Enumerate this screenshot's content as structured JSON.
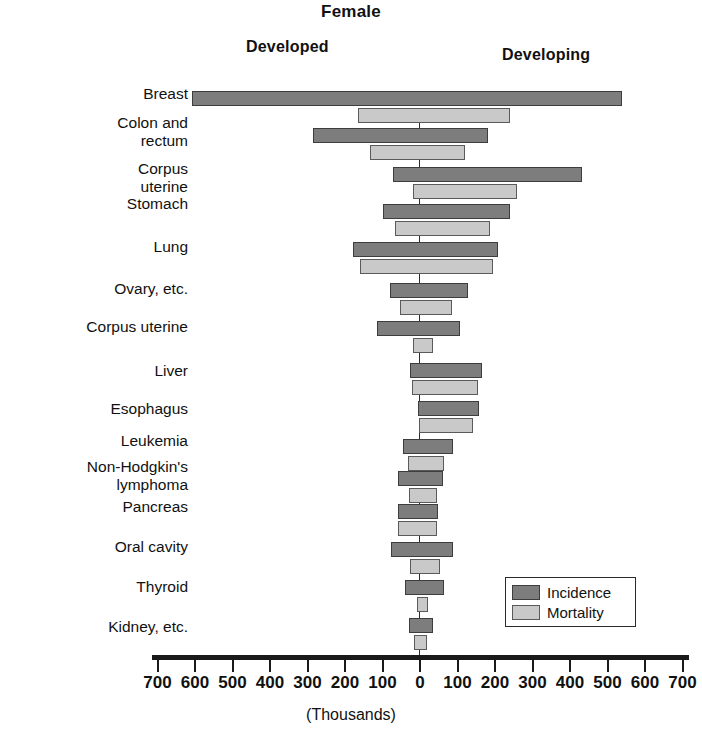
{
  "header": {
    "title": "Female",
    "left_region": "Developed",
    "right_region": "Developing"
  },
  "legend": {
    "incidence_label": "Incidence",
    "mortality_label": "Mortality",
    "incidence_color": "#7d7d7d",
    "mortality_color": "#c9c9c9"
  },
  "axis": {
    "title": "(Thousands)",
    "ticks": [
      "700",
      "600",
      "500",
      "400",
      "300",
      "200",
      "100",
      "0",
      "100",
      "200",
      "300",
      "400",
      "500",
      "600",
      "700"
    ],
    "zero_index": 7
  },
  "chart_data": {
    "type": "bar",
    "title": "Female",
    "subtitle": "",
    "xlabel": "(Thousands)",
    "ylabel": "",
    "orientation": "horizontal-diverging",
    "xlim": [
      -700,
      700
    ],
    "grid": false,
    "legend_position": "bottom-right",
    "legend_entries": [
      "Incidence",
      "Mortality"
    ],
    "left_side": "Developed",
    "right_side": "Developing",
    "units": "thousands of cases",
    "categories": [
      "Breast",
      "Colon and\nrectum",
      "Corpus\nuterine",
      "Stomach",
      "Lung",
      "Ovary, etc.",
      "Corpus uterine",
      "Liver",
      "Esophagus",
      "Leukemia",
      "Non-Hodgkin's\nlymphoma",
      "Pancreas",
      "Oral cavity",
      "Thyroid",
      "Kidney, etc."
    ],
    "series": [
      {
        "name": "Incidence",
        "developed": [
          608,
          285,
          72,
          98,
          178,
          80,
          115,
          27,
          5,
          45,
          58,
          60,
          78,
          40,
          30
        ],
        "developing": [
          539,
          182,
          432,
          240,
          208,
          128,
          107,
          165,
          158,
          88,
          62,
          48,
          88,
          64,
          35
        ]
      },
      {
        "name": "Mortality",
        "developed": [
          165,
          133,
          18,
          67,
          160,
          53,
          18,
          22,
          4,
          33,
          30,
          58,
          28,
          8,
          15
        ],
        "developing": [
          240,
          120,
          258,
          187,
          195,
          85,
          35,
          155,
          140,
          65,
          45,
          45,
          52,
          20,
          18
        ]
      }
    ]
  }
}
